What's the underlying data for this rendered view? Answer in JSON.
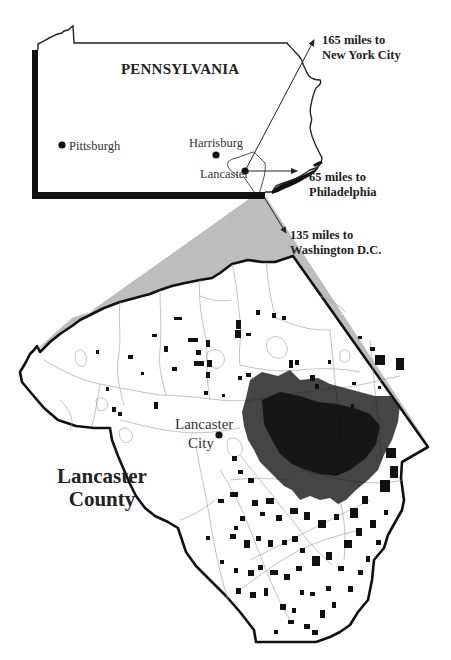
{
  "colors": {
    "outline": "#111111",
    "wedge": "#bdbdbd",
    "township_lines": "#9a9a9a",
    "farm_patches": "#111111",
    "background": "#ffffff"
  },
  "state_map": {
    "title": "PENNSYLVANIA",
    "cities": [
      {
        "name": "Pittsburgh",
        "icon": "city-dot-icon"
      },
      {
        "name": "Harrisburg",
        "icon": "city-dot-icon"
      },
      {
        "name": "Lancaster",
        "icon": "city-dot-icon"
      }
    ],
    "distances": [
      {
        "line1": "165 miles to",
        "line2": "New York City",
        "icon": "arrow-icon"
      },
      {
        "line1": "65 miles to",
        "line2": "Philadelphia",
        "icon": "arrow-icon"
      },
      {
        "line1": "135 miles to",
        "line2": "Washington D.C.",
        "icon": "arrow-icon"
      }
    ]
  },
  "county_map": {
    "title_line1": "Lancaster",
    "title_line2": "County",
    "city_label_line1": "Lancaster",
    "city_label_line2": "City",
    "city_icon": "city-dot-icon"
  }
}
